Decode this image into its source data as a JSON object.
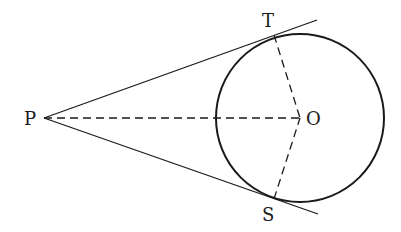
{
  "diagram": {
    "title": "",
    "labels": {
      "P": "P",
      "T": "T",
      "O": "O",
      "S": "S"
    },
    "points": {
      "P": [
        44,
        118
      ],
      "T": [
        274,
        35
      ],
      "O": [
        300,
        118
      ],
      "S": [
        274,
        199
      ]
    },
    "circle": {
      "center": "O",
      "radius": 84
    },
    "segments": [
      {
        "from": "P",
        "to": "T",
        "style": "solid",
        "extends_beyond_to": [
          317,
          20
        ]
      },
      {
        "from": "P",
        "to": "S",
        "style": "solid",
        "extends_beyond_to": [
          318,
          214
        ]
      },
      {
        "from": "P",
        "to": "O",
        "style": "dashed"
      },
      {
        "from": "T",
        "to": "O",
        "style": "dashed"
      },
      {
        "from": "S",
        "to": "O",
        "style": "dashed"
      }
    ],
    "colors": {
      "stroke": "#1a1a1a",
      "background": "#ffffff"
    }
  }
}
